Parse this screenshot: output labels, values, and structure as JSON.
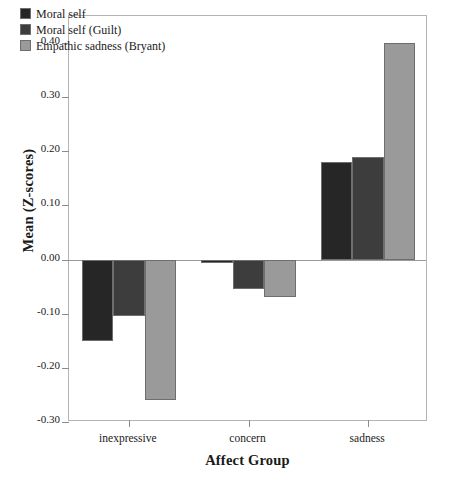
{
  "chart_data": {
    "type": "bar",
    "title": "",
    "xlabel": "Affect Group",
    "ylabel": "Mean (Z-scores)",
    "categories": [
      "inexpressive",
      "concern",
      "sadness"
    ],
    "series": [
      {
        "name": "Moral self",
        "color": "#262626",
        "values": [
          -0.15,
          -0.005,
          0.18
        ]
      },
      {
        "name": "Moral self (Guilt)",
        "color": "#3d3d3d",
        "values": [
          -0.105,
          -0.055,
          0.19
        ]
      },
      {
        "name": "Empathic sadness (Bryant)",
        "color": "#9a9a9a",
        "values": [
          -0.26,
          -0.07,
          0.4
        ]
      }
    ],
    "ylim": [
      -0.3,
      0.45
    ],
    "yticks": [
      0.4,
      0.3,
      0.2,
      0.1,
      0.0,
      -0.1,
      -0.2,
      -0.3
    ],
    "ytick_labels": [
      "0.40",
      "0.30",
      "0.20",
      "0.10",
      "0.00",
      "-0.10",
      "-0.20",
      "-0.30"
    ],
    "grid": false,
    "legend_position": "top-left",
    "zero_line": 0.0
  },
  "legend": {
    "items": [
      {
        "label": "Moral self"
      },
      {
        "label": "Moral self (Guilt)"
      },
      {
        "label": "Empathic sadness (Bryant)"
      }
    ]
  },
  "axes": {
    "x_title": "Affect Group",
    "y_title": "Mean (Z-scores)"
  }
}
